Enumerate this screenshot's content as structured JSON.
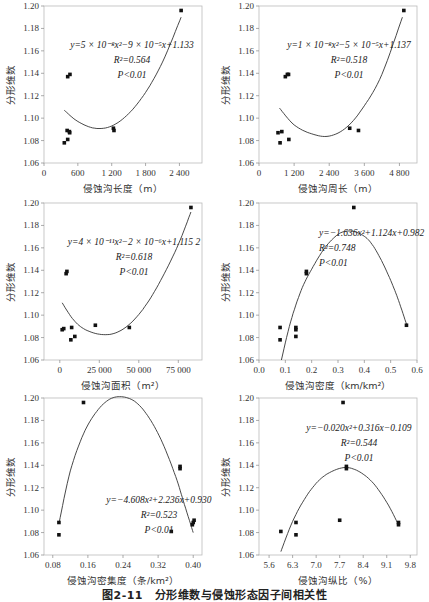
{
  "caption": "图2-11　分形维数与侵蚀形态因子间相关性",
  "chart_data": [
    {
      "type": "scatter",
      "id": "length",
      "xlabel": "侵蚀沟长度（m）",
      "ylabel": "分形维数",
      "xlim": [
        0,
        2800
      ],
      "ylim": [
        1.06,
        1.2
      ],
      "xticks": [
        0,
        600,
        1200,
        1800,
        2400
      ],
      "xtick_labels": [
        "0",
        "600",
        "1 200",
        "1 800",
        "2 400"
      ],
      "yticks": [
        1.06,
        1.08,
        1.1,
        1.12,
        1.14,
        1.16,
        1.18,
        1.2
      ],
      "points": [
        [
          360,
          1.078
        ],
        [
          420,
          1.081
        ],
        [
          410,
          1.089
        ],
        [
          450,
          1.088
        ],
        [
          455,
          1.087
        ],
        [
          420,
          1.137
        ],
        [
          460,
          1.139
        ],
        [
          1230,
          1.091
        ],
        [
          1240,
          1.089
        ],
        [
          2430,
          1.196
        ]
      ],
      "fit": {
        "a": 5e-08,
        "b": -9e-05,
        "c": 1.133,
        "x_range": [
          360,
          2430
        ],
        "display_a": 5e-08,
        "curve_points": [
          [
            360,
            1.107
          ],
          [
            600,
            1.097
          ],
          [
            900,
            1.091
          ],
          [
            1200,
            1.093
          ],
          [
            1500,
            1.104
          ],
          [
            1800,
            1.123
          ],
          [
            2100,
            1.15
          ],
          [
            2430,
            1.19
          ]
        ]
      },
      "annotations": [
        "y=5 × 10⁻⁸x²−9 × 10⁻⁵x+1.133",
        "R²=0.564",
        "P<0.01"
      ],
      "ann_pos": [
        [
          88,
          42
        ],
        [
          88,
          57
        ],
        [
          88,
          72
        ]
      ],
      "ann_anchor": "middle"
    },
    {
      "type": "scatter",
      "id": "perimeter",
      "xlabel": "侵蚀沟周长（m）",
      "ylabel": "分形维数",
      "xlim": [
        0,
        5400
      ],
      "ylim": [
        1.06,
        1.2
      ],
      "xticks": [
        0,
        1200,
        2400,
        3600,
        4800
      ],
      "xtick_labels": [
        "0",
        "1 200",
        "2 400",
        "3 600",
        "4 800"
      ],
      "yticks": [
        1.06,
        1.08,
        1.1,
        1.12,
        1.14,
        1.16,
        1.18,
        1.2
      ],
      "points": [
        [
          720,
          1.078
        ],
        [
          650,
          1.087
        ],
        [
          780,
          1.088
        ],
        [
          1020,
          1.081
        ],
        [
          900,
          1.137
        ],
        [
          970,
          1.139
        ],
        [
          1010,
          1.139
        ],
        [
          3100,
          1.091
        ],
        [
          3400,
          1.089
        ],
        [
          4950,
          1.196
        ]
      ],
      "fit": {
        "curve_points": [
          [
            700,
            1.109
          ],
          [
            1200,
            1.094
          ],
          [
            1800,
            1.086
          ],
          [
            2400,
            1.084
          ],
          [
            3000,
            1.092
          ],
          [
            3600,
            1.111
          ],
          [
            4200,
            1.139
          ],
          [
            4900,
            1.19
          ]
        ]
      },
      "annotations": [
        "y=1 × 10⁻⁸x²−5 × 10⁻⁵x+1.137",
        "R²=0.518",
        "P<0.01"
      ],
      "ann_pos": [
        [
          90,
          42
        ],
        [
          90,
          57
        ],
        [
          90,
          72
        ]
      ],
      "ann_anchor": "middle"
    },
    {
      "type": "scatter",
      "id": "area",
      "xlabel": "侵蚀沟面积（m²）",
      "ylabel": "分形维数",
      "xlim": [
        -10000,
        90000
      ],
      "ylim": [
        1.06,
        1.2
      ],
      "xticks": [
        0,
        25000,
        50000,
        75000
      ],
      "xtick_labels": [
        "0",
        "25 000",
        "50 000",
        "75 000"
      ],
      "yticks": [
        1.06,
        1.08,
        1.1,
        1.12,
        1.14,
        1.16,
        1.18,
        1.2
      ],
      "points": [
        [
          1500,
          1.087
        ],
        [
          2500,
          1.088
        ],
        [
          4000,
          1.137
        ],
        [
          4500,
          1.139
        ],
        [
          7000,
          1.078
        ],
        [
          7500,
          1.089
        ],
        [
          9500,
          1.081
        ],
        [
          22500,
          1.091
        ],
        [
          44000,
          1.089
        ],
        [
          83000,
          1.196
        ]
      ],
      "fit": {
        "curve_points": [
          [
            1500,
            1.111
          ],
          [
            8000,
            1.097
          ],
          [
            15000,
            1.088
          ],
          [
            25000,
            1.083
          ],
          [
            35000,
            1.084
          ],
          [
            45000,
            1.093
          ],
          [
            55000,
            1.11
          ],
          [
            65000,
            1.134
          ],
          [
            75000,
            1.163
          ],
          [
            83000,
            1.192
          ]
        ]
      },
      "annotations": [
        "y=4 × 10⁻¹¹x²−2 × 10⁻⁶x+1.115 2",
        "R²=0.618",
        "P<0.01"
      ],
      "ann_pos": [
        [
          90,
          42
        ],
        [
          90,
          57
        ],
        [
          90,
          72
        ]
      ],
      "ann_anchor": "middle"
    },
    {
      "type": "scatter",
      "id": "density",
      "xlabel": "侵蚀沟密度（km/km²）",
      "ylabel": "分形维数",
      "xlim": [
        0.0,
        0.6
      ],
      "ylim": [
        1.06,
        1.2
      ],
      "xticks": [
        0.0,
        0.1,
        0.2,
        0.3,
        0.4,
        0.5,
        0.6
      ],
      "xtick_labels": [
        "0.0",
        "0.1",
        "0.2",
        "0.3",
        "0.4",
        "0.5",
        "0.6"
      ],
      "yticks": [
        1.06,
        1.08,
        1.1,
        1.12,
        1.14,
        1.16,
        1.18,
        1.2
      ],
      "points": [
        [
          0.08,
          1.078
        ],
        [
          0.08,
          1.089
        ],
        [
          0.14,
          1.081
        ],
        [
          0.14,
          1.087
        ],
        [
          0.14,
          1.089
        ],
        [
          0.18,
          1.137
        ],
        [
          0.18,
          1.139
        ],
        [
          0.36,
          1.196
        ],
        [
          0.56,
          1.091
        ]
      ],
      "fit": {
        "curve_points": [
          [
            0.085,
            1.06
          ],
          [
            0.12,
            1.094
          ],
          [
            0.16,
            1.122
          ],
          [
            0.2,
            1.141
          ],
          [
            0.25,
            1.16
          ],
          [
            0.3,
            1.172
          ],
          [
            0.34,
            1.175
          ],
          [
            0.38,
            1.173
          ],
          [
            0.42,
            1.166
          ],
          [
            0.46,
            1.151
          ],
          [
            0.5,
            1.131
          ],
          [
            0.53,
            1.113
          ],
          [
            0.56,
            1.092
          ]
        ]
      },
      "annotations": [
        "y=−1.636x²+1.124x+0.982",
        "R²=0.748",
        "P<0.01"
      ],
      "ann_pos": [
        [
          60,
          33
        ],
        [
          60,
          48
        ],
        [
          60,
          63
        ]
      ],
      "ann_anchor": "start"
    },
    {
      "type": "scatter",
      "id": "frequency",
      "xlabel": "侵蚀沟密集度（条/km²）",
      "ylabel": "分形维数",
      "xlim": [
        0.06,
        0.42
      ],
      "ylim": [
        1.06,
        1.2
      ],
      "xticks": [
        0.08,
        0.16,
        0.24,
        0.32,
        0.4
      ],
      "xtick_labels": [
        "0.08",
        "0.16",
        "0.24",
        "0.32",
        "0.40"
      ],
      "yticks": [
        1.06,
        1.08,
        1.1,
        1.12,
        1.14,
        1.16,
        1.18,
        1.2
      ],
      "points": [
        [
          0.094,
          1.078
        ],
        [
          0.094,
          1.089
        ],
        [
          0.15,
          1.196
        ],
        [
          0.35,
          1.081
        ],
        [
          0.37,
          1.137
        ],
        [
          0.37,
          1.139
        ],
        [
          0.398,
          1.087
        ],
        [
          0.4,
          1.089
        ],
        [
          0.402,
          1.091
        ]
      ],
      "fit": {
        "curve_points": [
          [
            0.095,
            1.09
          ],
          [
            0.12,
            1.135
          ],
          [
            0.15,
            1.168
          ],
          [
            0.18,
            1.188
          ],
          [
            0.21,
            1.199
          ],
          [
            0.24,
            1.201
          ],
          [
            0.27,
            1.196
          ],
          [
            0.3,
            1.182
          ],
          [
            0.33,
            1.16
          ],
          [
            0.36,
            1.13
          ],
          [
            0.38,
            1.105
          ],
          [
            0.4,
            1.08
          ]
        ]
      },
      "annotations": [
        "y=−4.608x²+2.236x+0.930",
        "R²=0.523",
        "P<0.01"
      ],
      "ann_pos": [
        [
          115,
          105
        ],
        [
          115,
          120
        ],
        [
          115,
          135
        ]
      ],
      "ann_anchor": "middle"
    },
    {
      "type": "scatter",
      "id": "gradient",
      "xlabel": "侵蚀沟纵比（%）",
      "ylabel": "分形维数",
      "xlim": [
        5.3,
        10.0
      ],
      "ylim": [
        1.06,
        1.2
      ],
      "xticks": [
        5.6,
        6.3,
        7.0,
        7.7,
        8.4,
        9.1,
        9.8
      ],
      "xtick_labels": [
        "5.6",
        "6.3",
        "7.0",
        "7.7",
        "8.4",
        "9.1",
        "9.8"
      ],
      "yticks": [
        1.06,
        1.08,
        1.1,
        1.12,
        1.14,
        1.16,
        1.18,
        1.2
      ],
      "points": [
        [
          5.95,
          1.081
        ],
        [
          6.4,
          1.078
        ],
        [
          6.4,
          1.089
        ],
        [
          7.7,
          1.091
        ],
        [
          7.8,
          1.196
        ],
        [
          7.9,
          1.137
        ],
        [
          7.9,
          1.139
        ],
        [
          9.45,
          1.087
        ],
        [
          9.45,
          1.089
        ]
      ],
      "fit": {
        "curve_points": [
          [
            5.95,
            1.063
          ],
          [
            6.3,
            1.09
          ],
          [
            6.7,
            1.112
          ],
          [
            7.1,
            1.127
          ],
          [
            7.5,
            1.135
          ],
          [
            7.9,
            1.138
          ],
          [
            8.3,
            1.134
          ],
          [
            8.7,
            1.124
          ],
          [
            9.1,
            1.107
          ],
          [
            9.45,
            1.087
          ]
        ]
      },
      "annotations": [
        "y=−0.020x²+0.316x−0.109",
        "R²=0.544",
        "P<0.01"
      ],
      "ann_pos": [
        [
          100,
          33
        ],
        [
          100,
          48
        ],
        [
          100,
          63
        ]
      ],
      "ann_anchor": "middle"
    }
  ]
}
